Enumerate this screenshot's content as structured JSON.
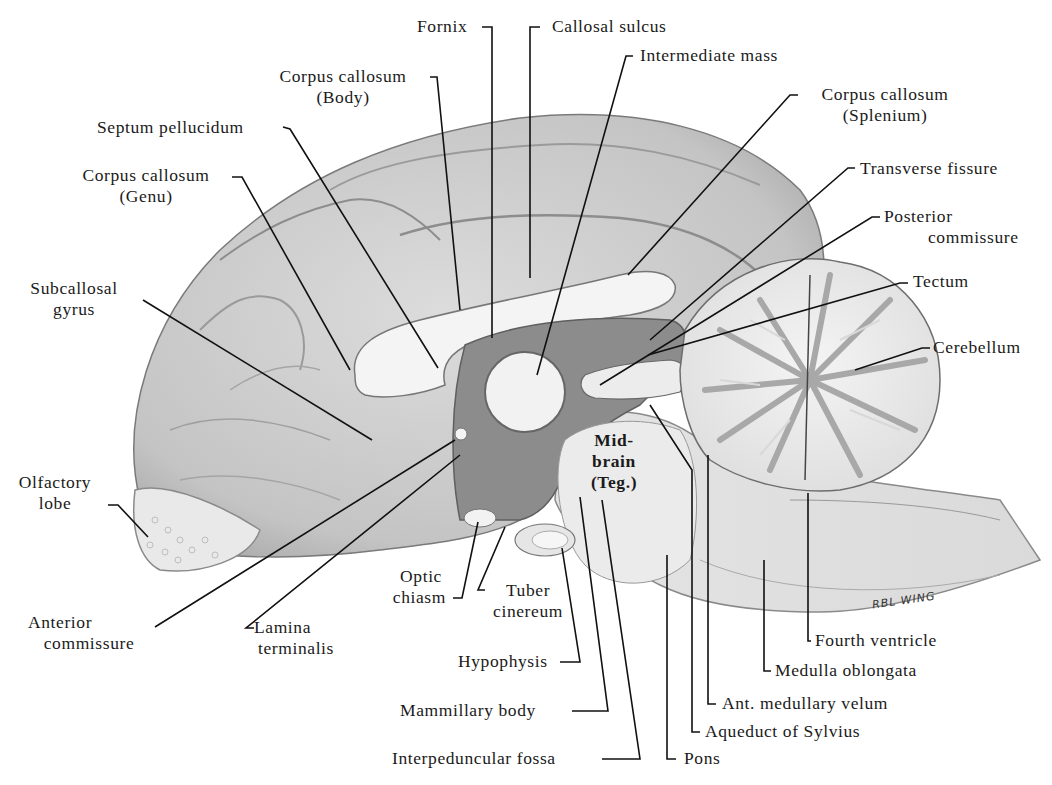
{
  "figure": {
    "signature": "RBL WING",
    "colors": {
      "background": "#ffffff",
      "ink": "#1a1a1a",
      "cortex": "#c9c9c9",
      "cortex_dark": "#9a9a9a",
      "white_matter": "#eeeeee",
      "ventricle_dark": "#6e6e6e",
      "cerebellum_gray": "#b5b5b5"
    }
  },
  "labels": {
    "fornix": "Fornix",
    "callosal_sulcus": "Callosal sulcus",
    "intermediate_mass": "Intermediate mass",
    "cc_body_1": "Corpus callosum",
    "cc_body_2": "(Body)",
    "cc_splenium_1": "Corpus callosum",
    "cc_splenium_2": "(Splenium)",
    "septum_pellucidum": "Septum pellucidum",
    "cc_genu_1": "Corpus callosum",
    "cc_genu_2": "(Genu)",
    "transverse_fissure": "Transverse fissure",
    "posterior_commissure_1": "Posterior",
    "posterior_commissure_2": "commissure",
    "tectum": "Tectum",
    "cerebellum": "Cerebellum",
    "subcallosal_gyrus_1": "Subcallosal",
    "subcallosal_gyrus_2": "gyrus",
    "olfactory_lobe_1": "Olfactory",
    "olfactory_lobe_2": "lobe",
    "midbrain_1": "Mid-",
    "midbrain_2": "brain",
    "midbrain_3": "(Teg.)",
    "optic_chiasm_1": "Optic",
    "optic_chiasm_2": "chiasm",
    "tuber_cinereum_1": "Tuber",
    "tuber_cinereum_2": "cinereum",
    "anterior_commissure_1": "Anterior",
    "anterior_commissure_2": "commissure",
    "lamina_terminalis_1": "Lamina",
    "lamina_terminalis_2": "terminalis",
    "hypophysis": "Hypophysis",
    "mammillary_body": "Mammillary body",
    "interpeduncular_fossa": "Interpeduncular fossa",
    "pons": "Pons",
    "aqueduct_of_sylvius": "Aqueduct of Sylvius",
    "ant_medullary_velum": "Ant. medullary velum",
    "medulla_oblongata": "Medulla oblongata",
    "fourth_ventricle": "Fourth ventricle"
  }
}
